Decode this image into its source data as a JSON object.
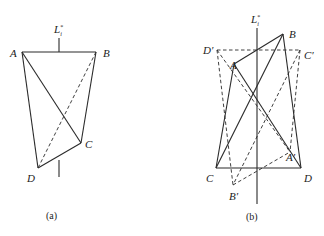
{
  "figure": {
    "panel_a": {
      "caption": "(a)",
      "axis_label": "L",
      "axis_sup": "*",
      "axis_sub": "i",
      "vertices": {
        "A": {
          "label": "A",
          "x": 22,
          "y": 52
        },
        "B": {
          "label": "B",
          "x": 96,
          "y": 52
        },
        "C": {
          "label": "C",
          "x": 81,
          "y": 143
        },
        "D": {
          "label": "D",
          "x": 38,
          "y": 168
        }
      },
      "solid_edges": [
        [
          "A",
          "B"
        ],
        [
          "A",
          "C"
        ],
        [
          "A",
          "D"
        ],
        [
          "B",
          "C"
        ],
        [
          "C",
          "D"
        ]
      ],
      "dashed_edges": [
        [
          "B",
          "D"
        ]
      ]
    },
    "panel_b": {
      "caption": "(b)",
      "axis_label": "L",
      "axis_sup": "*",
      "axis_sub": "i",
      "vertices": {
        "A": {
          "label": "A",
          "x": 234,
          "y": 64
        },
        "B": {
          "label": "B",
          "x": 283,
          "y": 34
        },
        "C": {
          "label": "C",
          "x": 216,
          "y": 168
        },
        "D": {
          "label": "D",
          "x": 301,
          "y": 168
        },
        "A_prime": {
          "label": "A′",
          "x": 290,
          "y": 152
        },
        "B_prime": {
          "label": "B′",
          "x": 233,
          "y": 185
        },
        "C_prime": {
          "label": "C′",
          "x": 300,
          "y": 50
        },
        "D_prime": {
          "label": "D′",
          "x": 217,
          "y": 50
        }
      },
      "solid_edges": [
        [
          "A",
          "B"
        ],
        [
          "A",
          "C"
        ],
        [
          "A",
          "D"
        ],
        [
          "B",
          "C"
        ],
        [
          "B",
          "D"
        ],
        [
          "C",
          "D"
        ]
      ],
      "dashed_edges": [
        [
          "D_prime",
          "C_prime"
        ],
        [
          "D_prime",
          "B_prime"
        ],
        [
          "D_prime",
          "A_prime"
        ],
        [
          "C_prime",
          "B_prime"
        ],
        [
          "C_prime",
          "A_prime"
        ],
        [
          "B_prime",
          "A_prime"
        ]
      ]
    }
  }
}
